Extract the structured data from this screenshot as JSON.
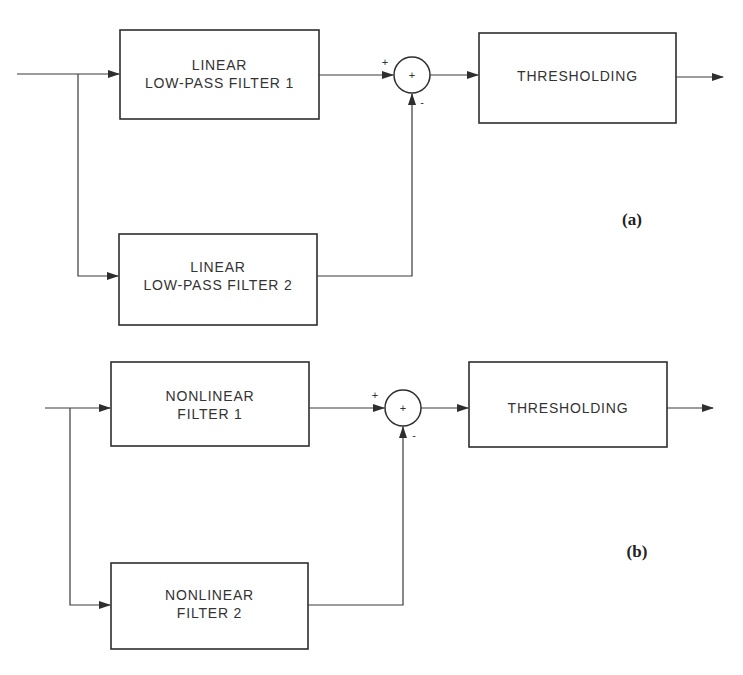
{
  "diagrams": [
    {
      "id": "a",
      "tag": "(a)",
      "filter1": {
        "line1": "LINEAR",
        "line2": "LOW-PASS FILTER 1"
      },
      "filter2": {
        "line1": "LINEAR",
        "line2": "LOW-PASS FILTER 2"
      },
      "summer": {
        "symbol": "+",
        "plus_sign": "+",
        "minus_sign": "-"
      },
      "threshold": {
        "label": "THRESHOLDING"
      }
    },
    {
      "id": "b",
      "tag": "(b)",
      "filter1": {
        "line1": "NONLINEAR",
        "line2": "FILTER 1"
      },
      "filter2": {
        "line1": "NONLINEAR",
        "line2": "FILTER 2"
      },
      "summer": {
        "symbol": "+",
        "plus_sign": "+",
        "minus_sign": "-"
      },
      "threshold": {
        "label": "THRESHOLDING"
      }
    }
  ]
}
